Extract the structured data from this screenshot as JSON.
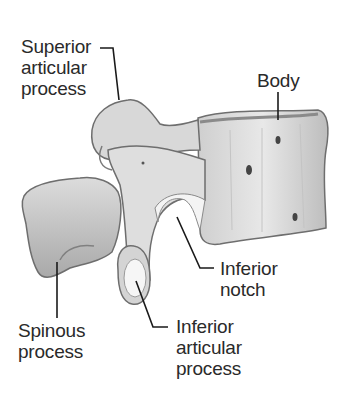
{
  "figure": {
    "colors": {
      "background": "#ffffff",
      "text": "#2a2a2a",
      "leader": "#1a1a1a",
      "bone_light": "#e6e6e6",
      "bone_mid": "#bdbdbd",
      "bone_dark": "#6e6e6e"
    }
  },
  "labels": {
    "superior_articular": {
      "line1": "Superior",
      "line2": "articular",
      "line3": "process"
    },
    "body": {
      "line1": "Body"
    },
    "inferior_notch": {
      "line1": "Inferior",
      "line2": "notch"
    },
    "spinous": {
      "line1": "Spinous",
      "line2": "process"
    },
    "inferior_articular": {
      "line1": "Inferior",
      "line2": "articular",
      "line3": "process"
    }
  }
}
